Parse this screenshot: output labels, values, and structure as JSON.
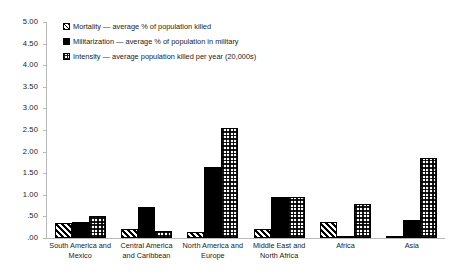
{
  "chart_data": {
    "type": "bar",
    "title": "",
    "xlabel": "",
    "ylabel": "",
    "ylim": [
      0,
      5
    ],
    "ytick_step": 0.5,
    "grid": false,
    "legend_position": "top-center",
    "categories": [
      "South America and Mexico",
      "Central America and Caribbean",
      "North America and Europe",
      "Middle East and North Africa",
      "Africa",
      "Asia"
    ],
    "ytick_labels": [
      "5.00",
      "4.50",
      "4.00",
      "3.50",
      "3.00",
      "2.50",
      "2.00",
      "1.50",
      "1.00",
      ".50",
      ".00"
    ],
    "ytick_values": [
      5.0,
      4.5,
      4.0,
      3.5,
      3.0,
      2.5,
      2.0,
      1.5,
      1.0,
      0.5,
      0.0
    ],
    "series": [
      {
        "name": "Mortality",
        "legend_label": "Mortality — average % of population killed",
        "pattern": "diagonal-hatch",
        "values": [
          0.35,
          0.2,
          0.15,
          0.2,
          0.38,
          0.04
        ]
      },
      {
        "name": "Militarization",
        "legend_label": "Militarization — average % of population in military",
        "pattern": "solid-black",
        "values": [
          0.37,
          0.72,
          1.65,
          0.95,
          0.04,
          0.42
        ]
      },
      {
        "name": "Intensity",
        "legend_label": "Intensity — average population killed per year (20,000s)",
        "pattern": "checker-grid",
        "values": [
          0.51,
          0.17,
          2.55,
          0.95,
          0.78,
          1.85
        ]
      }
    ]
  },
  "colors": {
    "axis": "#b9b9b9",
    "text": "#1a1a1a",
    "bar_outline": "#000000",
    "solid_fill": "#000000",
    "background": "#ffffff"
  }
}
